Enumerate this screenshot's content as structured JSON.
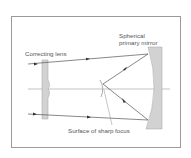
{
  "diagram": {
    "labels": {
      "correcting_lens": "Correcting lens",
      "mirror_line1": "Spherical",
      "mirror_line2": "primary mirror",
      "focus": "Surface of sharp focus"
    },
    "colors": {
      "line": "#555555",
      "fill": "#cfcfcf",
      "border": "#9a9a9a"
    }
  }
}
